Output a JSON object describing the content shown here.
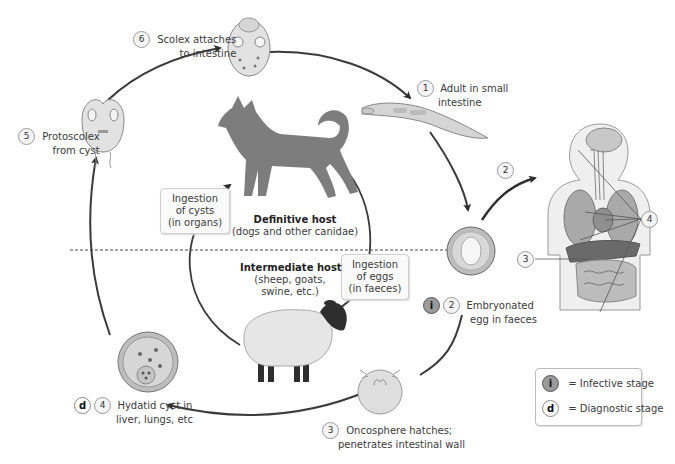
{
  "stages": [
    {
      "number": "1",
      "label_lines": [
        "Adult in small",
        "intestine"
      ]
    },
    {
      "number": "2",
      "badge": "i",
      "label_lines": [
        "Embryonated",
        "egg in faeces"
      ]
    },
    {
      "number": "3",
      "label_lines": [
        "Oncosphere hatches;",
        "penetrates intestinal wall"
      ]
    },
    {
      "number": "4",
      "badge": "d",
      "label_lines": [
        "Hydatid cyst in",
        "liver, lungs, etc"
      ]
    },
    {
      "number": "5",
      "label_lines": [
        "Protoscolex",
        "from cyst"
      ]
    },
    {
      "number": "6",
      "label_lines": [
        "Scolex attaches",
        "to intestine"
      ]
    }
  ],
  "human_markers": {
    "ingestion": "2",
    "intestine": "3",
    "organs": "4"
  },
  "boxes": {
    "cysts": [
      "Ingestion",
      "of cysts",
      "(in organs)"
    ],
    "eggs": [
      "Ingestion",
      "of eggs",
      "(in faeces)"
    ]
  },
  "definitive_host": {
    "title": "Definitive host",
    "subtitle": "(dogs and other canidae)"
  },
  "intermediate_host": {
    "title": "Intermediate host",
    "subtitle_lines": [
      "(sheep, goats,",
      "swine, etc.)"
    ]
  },
  "legend": {
    "infective": {
      "symbol": "i",
      "label": "= Infective stage"
    },
    "diagnostic": {
      "symbol": "d",
      "label": "= Diagnostic stage"
    }
  },
  "colors": {
    "arrow": "#3a3a3a",
    "dog": "#7d7d7d",
    "sheep_body": "#e6e6e6",
    "sheep_head": "#2e2e2e",
    "badge_i": "#9a9a9a"
  }
}
